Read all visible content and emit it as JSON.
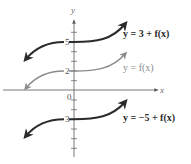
{
  "diagram": {
    "type": "function-graph-vertical-shifts",
    "axes": {
      "x_label": "x",
      "y_label": "y",
      "origin_label": "0",
      "tick_labels": [
        {
          "value": 5,
          "text": "5"
        },
        {
          "value": 2,
          "text": "2"
        },
        {
          "value": -3,
          "text": "-3"
        }
      ]
    },
    "curves": [
      {
        "label": "y = 3 + f(x)",
        "y_intercept": 5,
        "color": "#2b2b2b",
        "emphasis": "bold"
      },
      {
        "label": "y = f(x)",
        "y_intercept": 2,
        "color": "#8a8a8a",
        "emphasis": "normal"
      },
      {
        "label": "y = −5 + f(x)",
        "y_intercept": -3,
        "color": "#2b2b2b",
        "emphasis": "bold"
      }
    ]
  },
  "colors": {
    "axis": "#6a6a6a",
    "dark_curve": "#2b2b2b",
    "light_curve": "#8a8a8a",
    "background": "#ffffff"
  }
}
